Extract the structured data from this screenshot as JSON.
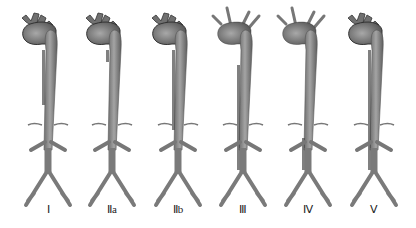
{
  "figure": {
    "colors": {
      "vessel": "#8a8a8a",
      "vessel_dark": "#555555",
      "outline": "#3a3a3a",
      "background": "#ffffff"
    },
    "types": [
      {
        "label": "Ⅰ",
        "x": 48,
        "arch": "dissected",
        "desc": "ascending + arch + descending",
        "false_lumen": [
          40,
          105
        ],
        "branches": "thick"
      },
      {
        "label": "Ⅱa",
        "x": 112,
        "arch": "dissected",
        "desc": "ascending only",
        "false_lumen": [
          40,
          62
        ],
        "branches": "thick"
      },
      {
        "label": "Ⅱb",
        "x": 178,
        "arch": "dissected",
        "desc": "ascending + arch + descending",
        "false_lumen": [
          40,
          130
        ],
        "branches": "thick"
      },
      {
        "label": "Ⅲ",
        "x": 243,
        "arch": "normal",
        "desc": "descending to iliac",
        "false_lumen": [
          55,
          170
        ],
        "branches": "thin"
      },
      {
        "label": "Ⅳ",
        "x": 308,
        "arch": "normal",
        "desc": "abdominal",
        "false_lumen": [
          128,
          170
        ],
        "branches": "thin"
      },
      {
        "label": "Ⅴ",
        "x": 374,
        "arch": "dissected",
        "desc": "entire aorta",
        "false_lumen": [
          40,
          170
        ],
        "branches": "thick"
      }
    ]
  }
}
